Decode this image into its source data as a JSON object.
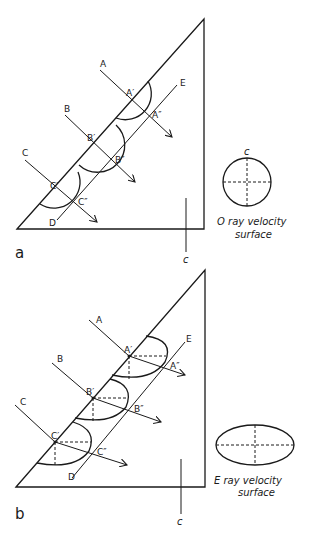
{
  "figure_a": {
    "panel_label": "a",
    "optic_axis_label": "c",
    "ray_labels": [
      "A",
      "B",
      "C"
    ],
    "entry_labels": [
      "A′",
      "B′",
      "C′"
    ],
    "exit_labels": [
      "A″",
      "B″",
      "C″"
    ],
    "wavefront_start": "D",
    "wavefront_end": "E",
    "surface_axis_label": "c",
    "surface_caption_line1": "O ray velocity",
    "surface_caption_line2": "surface"
  },
  "figure_b": {
    "panel_label": "b",
    "optic_axis_label": "c",
    "ray_labels": [
      "A",
      "B",
      "C"
    ],
    "entry_labels": [
      "A′",
      "B′",
      "C′"
    ],
    "exit_labels": [
      "A″",
      "B″",
      "C″"
    ],
    "wavefront_start": "D",
    "wavefront_end": "E",
    "surface_caption_line1": "E ray velocity",
    "surface_caption_line2": "surface"
  }
}
